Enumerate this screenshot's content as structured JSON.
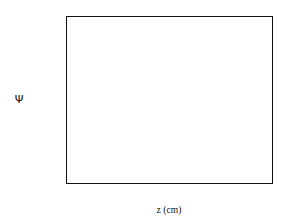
{
  "chart_data": {
    "type": "line",
    "title": "",
    "xlabel": "z (cm)",
    "ylabel": "Ψ",
    "xlim": [
      0,
      0.6
    ],
    "ylim": [
      0,
      0.18
    ],
    "xticks": [
      "0",
      "0.1",
      "0.2",
      "0.3",
      "0.4",
      "0.5",
      "0.6"
    ],
    "xtick_values": [
      0,
      0.1,
      0.2,
      0.3,
      0.4,
      0.5,
      0.6
    ],
    "yticks": [
      "0",
      "0.02",
      "0.04",
      "0.06",
      "0.08",
      "0.1",
      "0.12",
      "0.14",
      "0.16",
      "0.18"
    ],
    "ytick_values": [
      0,
      0.02,
      0.04,
      0.06,
      0.08,
      0.1,
      0.12,
      0.14,
      0.16,
      0.18
    ],
    "grid": false,
    "legend_position": "upper-right",
    "series": [
      {
        "name": "t = 1.e-06 sec",
        "style": "solid",
        "color": "#000000",
        "amplitude": 0.0205,
        "decay_length": 0.0255,
        "x": [
          0,
          0.02,
          0.04,
          0.06,
          0.08,
          0.1,
          0.12,
          0.15,
          0.2,
          0.25,
          0.3,
          0.4,
          0.5,
          0.6
        ],
        "values": [
          0.0205,
          0.0094,
          0.0043,
          0.002,
          0.0009,
          0.0004,
          0.0002,
          0.0001,
          0.0,
          0.0,
          0.0,
          0.0,
          0.0,
          0.0
        ]
      },
      {
        "name": "t = 2.e-06 sec",
        "style": "dotted",
        "color": "#000000",
        "amplitude": 0.0405,
        "decay_length": 0.0362,
        "x": [
          0,
          0.02,
          0.04,
          0.06,
          0.08,
          0.1,
          0.12,
          0.15,
          0.2,
          0.25,
          0.3,
          0.4,
          0.5,
          0.6
        ],
        "values": [
          0.0405,
          0.0232,
          0.0133,
          0.0076,
          0.0044,
          0.0025,
          0.0014,
          0.0006,
          0.0002,
          0.0,
          0.0,
          0.0,
          0.0,
          0.0
        ]
      },
      {
        "name": "t = 4.e-06 sec",
        "style": "fine-dashed",
        "color": "#555555",
        "amplitude": 0.0795,
        "decay_length": 0.0515,
        "x": [
          0,
          0.02,
          0.04,
          0.06,
          0.08,
          0.1,
          0.12,
          0.15,
          0.2,
          0.25,
          0.3,
          0.4,
          0.5,
          0.6
        ],
        "values": [
          0.0795,
          0.0539,
          0.0365,
          0.0248,
          0.0168,
          0.0114,
          0.0077,
          0.0043,
          0.0016,
          0.0006,
          0.0002,
          0.0,
          0.0,
          0.0
        ]
      },
      {
        "name": "t = 8.e-06 sec",
        "style": "dash-dot",
        "color": "#7a7a7a",
        "amplitude": 0.16,
        "decay_length": 0.0955,
        "x": [
          0,
          0.02,
          0.04,
          0.06,
          0.08,
          0.1,
          0.12,
          0.15,
          0.2,
          0.25,
          0.3,
          0.4,
          0.5,
          0.6
        ],
        "values": [
          0.16,
          0.1297,
          0.1051,
          0.0852,
          0.0691,
          0.056,
          0.0454,
          0.0331,
          0.0192,
          0.0112,
          0.0065,
          0.0022,
          0.0007,
          0.0003
        ]
      }
    ]
  }
}
